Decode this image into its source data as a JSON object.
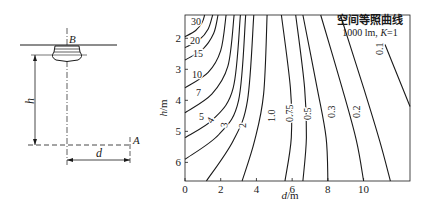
{
  "schematic": {
    "point_b": "B",
    "point_a": "A",
    "height_label": "h",
    "distance_label": "d"
  },
  "chart_data": {
    "type": "line",
    "title": "空间等照曲线",
    "subtitle": "1000 lm, K=1",
    "subtitle_parts": {
      "prefix": "1000 lm, ",
      "k": "K",
      "suffix": "=1"
    },
    "xlabel": "d/m",
    "xlabel_parts": {
      "var": "d",
      "unit": "/m"
    },
    "ylabel": "h/m",
    "ylabel_parts": {
      "var": "h",
      "unit": "/m"
    },
    "xlim": [
      0,
      12.6
    ],
    "ylim": [
      1.25,
      6.6
    ],
    "y_inverted": true,
    "grid": false,
    "x_ticks": [
      "0",
      "2",
      "4",
      "6",
      "8",
      "10"
    ],
    "y_ticks": [
      "2",
      "3",
      "4",
      "5",
      "6"
    ],
    "series": [
      {
        "name": "30",
        "label": "30",
        "points": [
          [
            0,
            1.95
          ],
          [
            0.6,
            1.75
          ],
          [
            0.95,
            1.5
          ],
          [
            1.1,
            1.25
          ]
        ]
      },
      {
        "name": "20",
        "label": "20",
        "points": [
          [
            0,
            2.3
          ],
          [
            0.8,
            2.05
          ],
          [
            1.3,
            1.7
          ],
          [
            1.55,
            1.25
          ]
        ]
      },
      {
        "name": "15",
        "label": "15",
        "points": [
          [
            0,
            2.7
          ],
          [
            1.0,
            2.35
          ],
          [
            1.6,
            1.85
          ],
          [
            1.85,
            1.25
          ]
        ]
      },
      {
        "name": "10",
        "label": "10",
        "points": [
          [
            0,
            3.6
          ],
          [
            1.3,
            3.1
          ],
          [
            2.0,
            2.4
          ],
          [
            2.3,
            1.25
          ]
        ]
      },
      {
        "name": "7",
        "label": "7",
        "points": [
          [
            0,
            4.4
          ],
          [
            1.5,
            3.8
          ],
          [
            2.4,
            2.9
          ],
          [
            2.75,
            1.25
          ]
        ]
      },
      {
        "name": "5",
        "label": "5",
        "points": [
          [
            0,
            5.2
          ],
          [
            1.6,
            4.6
          ],
          [
            2.7,
            3.6
          ],
          [
            3.1,
            1.25
          ]
        ]
      },
      {
        "name": "4",
        "label": "4",
        "points": [
          [
            0,
            5.9
          ],
          [
            1.9,
            5.1
          ],
          [
            3.0,
            4.0
          ],
          [
            3.4,
            1.25
          ]
        ]
      },
      {
        "name": "3",
        "label": "3",
        "points": [
          [
            1.2,
            6.6
          ],
          [
            2.7,
            5.3
          ],
          [
            3.5,
            4.0
          ],
          [
            3.85,
            1.25
          ]
        ]
      },
      {
        "name": "2",
        "label": "2",
        "points": [
          [
            3.2,
            6.6
          ],
          [
            3.9,
            5.3
          ],
          [
            4.4,
            3.8
          ],
          [
            4.6,
            1.25
          ]
        ]
      },
      {
        "name": "1.0",
        "label": "1.0",
        "points": [
          [
            5.6,
            6.6
          ],
          [
            5.95,
            5.2
          ],
          [
            5.9,
            3.6
          ],
          [
            5.4,
            1.25
          ]
        ]
      },
      {
        "name": "0.75",
        "label": "0.75",
        "points": [
          [
            6.6,
            6.6
          ],
          [
            6.8,
            5.2
          ],
          [
            6.7,
            3.6
          ],
          [
            6.2,
            1.25
          ]
        ]
      },
      {
        "name": "0.5",
        "label": "0.5",
        "points": [
          [
            8.0,
            6.6
          ],
          [
            7.9,
            5.2
          ],
          [
            7.4,
            3.6
          ],
          [
            6.6,
            1.25
          ]
        ]
      },
      {
        "name": "0.3",
        "label": "0.3",
        "points": [
          [
            10.0,
            6.6
          ],
          [
            9.6,
            5.3
          ],
          [
            8.8,
            3.6
          ],
          [
            7.6,
            1.25
          ]
        ]
      },
      {
        "name": "0.2",
        "label": "0.2",
        "points": [
          [
            11.5,
            6.6
          ],
          [
            10.9,
            5.3
          ],
          [
            10.0,
            3.6
          ],
          [
            8.7,
            1.25
          ]
        ]
      },
      {
        "name": "0.1",
        "label": "0.1",
        "points": [
          [
            12.6,
            4.2
          ],
          [
            11.9,
            3.2
          ],
          [
            11.2,
            2.2
          ]
        ]
      }
    ]
  }
}
